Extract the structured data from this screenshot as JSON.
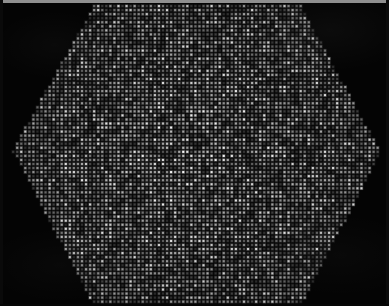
{
  "figure": {
    "kind": "micrograph",
    "width_px": 389,
    "height_px": 306,
    "background_color": "#040404",
    "dot_color_bright": "#ffffff",
    "dot_color_mid": "#b4b4b4",
    "dot_color_dim": "#3a3a3a",
    "top_strip_color": "#8f8f8f",
    "edge_strip_color": "#0a0a0a"
  },
  "lattice": {
    "type": "square",
    "pitch_x_px": 4.05,
    "pitch_y_px": 4.05,
    "dot_size_px": 2.1,
    "origin_x_px": 1.0,
    "origin_y_px": 2.0,
    "brightness_min": 0.18,
    "brightness_max": 1.0,
    "bright_fraction": 0.1,
    "random_seed": 20240517
  },
  "aperture": {
    "shape": "hexagon",
    "orientation": "flat-top",
    "clipped_at_bottom": true,
    "vertices": [
      {
        "name": "top-left-corner",
        "x": 95,
        "y": 4
      },
      {
        "name": "top-right-corner",
        "x": 300,
        "y": 4
      },
      {
        "name": "right-vertex",
        "x": 381,
        "y": 152
      },
      {
        "name": "bottom-right-corner",
        "x": 301,
        "y": 306
      },
      {
        "name": "bottom-left-corner",
        "x": 94,
        "y": 306
      },
      {
        "name": "left-vertex",
        "x": 12,
        "y": 150
      }
    ]
  },
  "borders": {
    "top": {
      "height_px": 3,
      "color": "#8f8f8f"
    },
    "left": {
      "width_px": 3,
      "color": "#0a0a0a"
    },
    "right": {
      "width_px": 3,
      "color": "#0b0b0b"
    },
    "bottom": {
      "height_px": 2,
      "color": "#060606"
    }
  }
}
